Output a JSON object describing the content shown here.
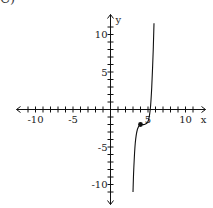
{
  "problem_label": "C)",
  "chart_data": {
    "type": "line",
    "title": "",
    "xlabel": "x",
    "ylabel": "y",
    "xlim": [
      -12,
      12
    ],
    "ylim": [
      -12,
      12
    ],
    "grid": false,
    "x_ticks": [
      -10,
      -5,
      5,
      10
    ],
    "y_ticks": [
      -10,
      -5,
      5,
      10
    ],
    "x_tick_labels": [
      "-10",
      "-5",
      "5",
      "10"
    ],
    "y_tick_labels": [
      "-10",
      "-5",
      "5",
      "10"
    ],
    "tick_step": 1,
    "series": [
      {
        "name": "f(x)",
        "description": "cubic curve with inflection (plateau) near (4, -2)",
        "points": [
          [
            3,
            -11
          ],
          [
            3.1,
            -8
          ],
          [
            3.3,
            -4.5
          ],
          [
            3.6,
            -2.6
          ],
          [
            4,
            -2
          ],
          [
            4.5,
            -2
          ],
          [
            5,
            -1.6
          ],
          [
            5.3,
            0
          ],
          [
            5.5,
            3
          ],
          [
            5.7,
            8
          ],
          [
            5.8,
            11.5
          ]
        ],
        "marked_point": [
          4,
          -2
        ]
      }
    ]
  }
}
